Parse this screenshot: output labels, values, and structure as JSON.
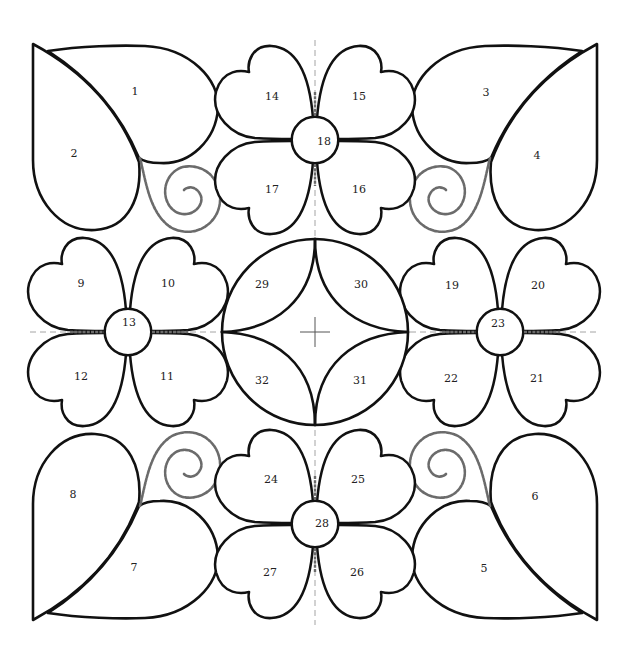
{
  "diagram": {
    "type": "numbered applique / quilt block pattern",
    "symmetry": "4-fold, mirrored about vertical and horizontal center guides",
    "colors": {
      "outline": "#111111",
      "stitch_lines": "#6b6b6b",
      "guides": "#9a9a9a",
      "fill": "#ffffff"
    },
    "pieces": [
      {
        "id": "1",
        "label": "1",
        "shape": "heart-leaf",
        "group": "top-left corner"
      },
      {
        "id": "2",
        "label": "2",
        "shape": "heart-leaf",
        "group": "top-left corner"
      },
      {
        "id": "3",
        "label": "3",
        "shape": "heart-leaf",
        "group": "top-right corner"
      },
      {
        "id": "4",
        "label": "4",
        "shape": "heart-leaf",
        "group": "top-right corner"
      },
      {
        "id": "5",
        "label": "5",
        "shape": "heart-leaf",
        "group": "bottom-right corner"
      },
      {
        "id": "6",
        "label": "6",
        "shape": "heart-leaf",
        "group": "bottom-right corner"
      },
      {
        "id": "7",
        "label": "7",
        "shape": "heart-leaf",
        "group": "bottom-left corner"
      },
      {
        "id": "8",
        "label": "8",
        "shape": "heart-leaf",
        "group": "bottom-left corner"
      },
      {
        "id": "9",
        "label": "9",
        "shape": "heart-petal",
        "group": "left flower"
      },
      {
        "id": "10",
        "label": "10",
        "shape": "heart-petal",
        "group": "left flower"
      },
      {
        "id": "11",
        "label": "11",
        "shape": "heart-petal",
        "group": "left flower"
      },
      {
        "id": "12",
        "label": "12",
        "shape": "heart-petal",
        "group": "left flower"
      },
      {
        "id": "13",
        "label": "13",
        "shape": "circle-center",
        "group": "left flower"
      },
      {
        "id": "14",
        "label": "14",
        "shape": "heart-petal",
        "group": "top flower"
      },
      {
        "id": "15",
        "label": "15",
        "shape": "heart-petal",
        "group": "top flower"
      },
      {
        "id": "16",
        "label": "16",
        "shape": "heart-petal",
        "group": "top flower"
      },
      {
        "id": "17",
        "label": "17",
        "shape": "heart-petal",
        "group": "top flower"
      },
      {
        "id": "18",
        "label": "18",
        "shape": "circle-center",
        "group": "top flower"
      },
      {
        "id": "19",
        "label": "19",
        "shape": "heart-petal",
        "group": "right flower"
      },
      {
        "id": "20",
        "label": "20",
        "shape": "heart-petal",
        "group": "right flower"
      },
      {
        "id": "21",
        "label": "21",
        "shape": "heart-petal",
        "group": "right flower"
      },
      {
        "id": "22",
        "label": "22",
        "shape": "heart-petal",
        "group": "right flower"
      },
      {
        "id": "23",
        "label": "23",
        "shape": "circle-center",
        "group": "right flower"
      },
      {
        "id": "24",
        "label": "24",
        "shape": "heart-petal",
        "group": "bottom flower"
      },
      {
        "id": "25",
        "label": "25",
        "shape": "heart-petal",
        "group": "bottom flower"
      },
      {
        "id": "26",
        "label": "26",
        "shape": "heart-petal",
        "group": "bottom flower"
      },
      {
        "id": "27",
        "label": "27",
        "shape": "heart-petal",
        "group": "bottom flower"
      },
      {
        "id": "28",
        "label": "28",
        "shape": "circle-center",
        "group": "bottom flower"
      },
      {
        "id": "29",
        "label": "29",
        "shape": "circle-segment",
        "group": "center medallion"
      },
      {
        "id": "30",
        "label": "30",
        "shape": "circle-segment",
        "group": "center medallion"
      },
      {
        "id": "31",
        "label": "31",
        "shape": "circle-segment",
        "group": "center medallion"
      },
      {
        "id": "32",
        "label": "32",
        "shape": "circle-segment",
        "group": "center medallion"
      }
    ],
    "decorations": [
      {
        "name": "spiral-top-left",
        "style": "dashed stitch line"
      },
      {
        "name": "spiral-top-right",
        "style": "dashed stitch line"
      },
      {
        "name": "spiral-bottom-left",
        "style": "dashed stitch line"
      },
      {
        "name": "spiral-bottom-right",
        "style": "dashed stitch line"
      }
    ],
    "guides": [
      {
        "name": "vertical-center-guide",
        "style": "dashed"
      },
      {
        "name": "horizontal-center-guide",
        "style": "dashed"
      }
    ]
  }
}
